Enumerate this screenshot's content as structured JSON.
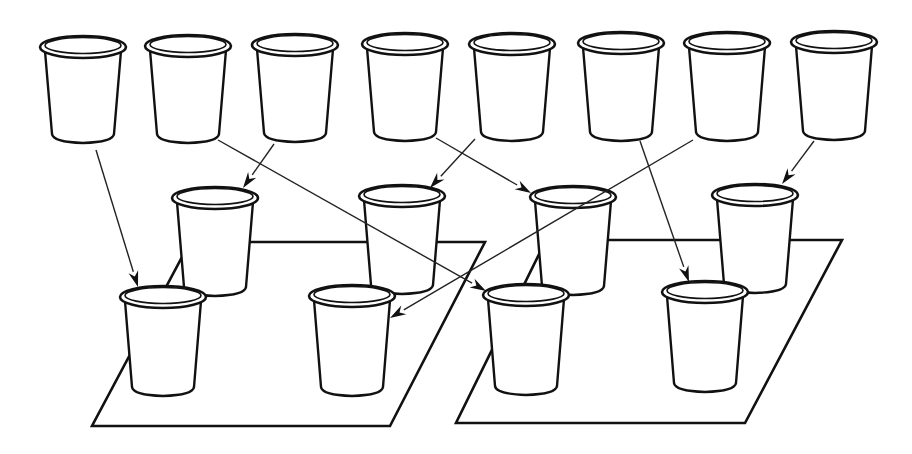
{
  "diagram": {
    "colors": {
      "line": "#111111",
      "background": "#ffffff"
    },
    "source_cups": [
      {
        "id": "top-1",
        "cx": 83,
        "rimY": 47,
        "bottomY": 140
      },
      {
        "id": "top-2",
        "cx": 188,
        "rimY": 46,
        "bottomY": 140
      },
      {
        "id": "top-3",
        "cx": 295,
        "rimY": 45,
        "bottomY": 139
      },
      {
        "id": "top-4",
        "cx": 405,
        "rimY": 44,
        "bottomY": 138
      },
      {
        "id": "top-5",
        "cx": 512,
        "rimY": 44,
        "bottomY": 138
      },
      {
        "id": "top-6",
        "cx": 621,
        "rimY": 43,
        "bottomY": 138
      },
      {
        "id": "top-7",
        "cx": 727,
        "rimY": 43,
        "bottomY": 138
      },
      {
        "id": "top-8",
        "cx": 834,
        "rimY": 42,
        "bottomY": 137
      }
    ],
    "trays": [
      {
        "id": "tray-left",
        "points": [
          [
            190,
            242
          ],
          [
            485,
            242
          ],
          [
            390,
            426
          ],
          [
            92,
            426
          ]
        ]
      },
      {
        "id": "tray-right",
        "points": [
          [
            546,
            240
          ],
          [
            842,
            240
          ],
          [
            745,
            423
          ],
          [
            456,
            423
          ]
        ]
      }
    ],
    "tray_cups": [
      {
        "id": "left-back-1",
        "cx": 215,
        "rimY": 198,
        "bottomY": 293
      },
      {
        "id": "left-back-2",
        "cx": 402,
        "rimY": 196,
        "bottomY": 291
      },
      {
        "id": "right-back-1",
        "cx": 573,
        "rimY": 197,
        "bottomY": 292
      },
      {
        "id": "right-back-2",
        "cx": 755,
        "rimY": 195,
        "bottomY": 290
      },
      {
        "id": "left-front-1",
        "cx": 163,
        "rimY": 297,
        "bottomY": 393
      },
      {
        "id": "left-front-2",
        "cx": 352,
        "rimY": 296,
        "bottomY": 393
      },
      {
        "id": "right-front-1",
        "cx": 526,
        "rimY": 295,
        "bottomY": 392
      },
      {
        "id": "right-front-2",
        "cx": 705,
        "rimY": 292,
        "bottomY": 389
      }
    ],
    "arrows": [
      {
        "from": "top-1",
        "to": "left-front-1",
        "x1": 96,
        "y1": 150,
        "x2": 138,
        "y2": 287
      },
      {
        "from": "top-2",
        "to": "right-front-1",
        "x1": 218,
        "y1": 140,
        "x2": 486,
        "y2": 291
      },
      {
        "from": "top-3",
        "to": "left-back-1",
        "x1": 274,
        "y1": 144,
        "x2": 243,
        "y2": 188
      },
      {
        "from": "top-4",
        "to": "right-back-1",
        "x1": 436,
        "y1": 138,
        "x2": 531,
        "y2": 193
      },
      {
        "from": "top-5",
        "to": "left-back-2",
        "x1": 475,
        "y1": 139,
        "x2": 430,
        "y2": 188
      },
      {
        "from": "top-6",
        "to": "right-front-2",
        "x1": 640,
        "y1": 141,
        "x2": 689,
        "y2": 282
      },
      {
        "from": "top-7",
        "to": "left-front-2",
        "x1": 693,
        "y1": 140,
        "x2": 390,
        "y2": 318
      },
      {
        "from": "top-8",
        "to": "right-back-2",
        "x1": 814,
        "y1": 141,
        "x2": 782,
        "y2": 184
      }
    ]
  }
}
